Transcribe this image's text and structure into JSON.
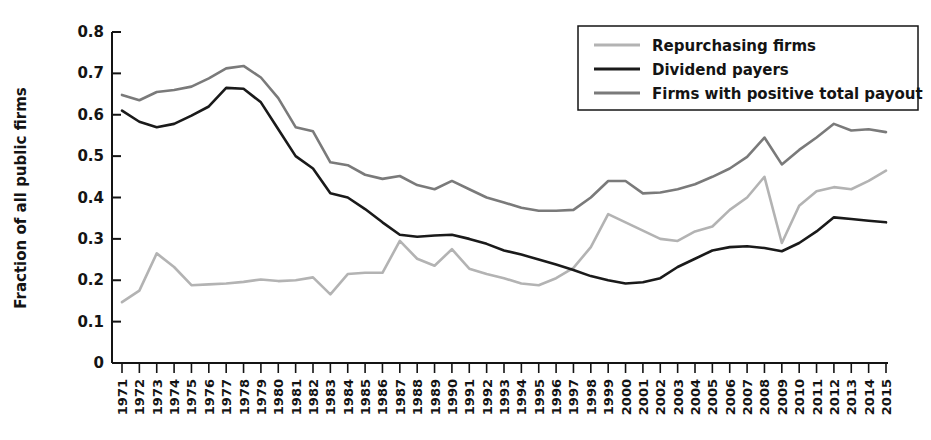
{
  "chart_data": {
    "type": "line",
    "title": "",
    "xlabel": "",
    "ylabel": "Fraction of all public firms",
    "ylim": [
      0,
      0.8
    ],
    "ytick_values": [
      0,
      0.1,
      0.2,
      0.3,
      0.4,
      0.5,
      0.6,
      0.7,
      0.8
    ],
    "ytick_labels": [
      "0",
      "0.1",
      "0.2",
      "0.3",
      "0.4",
      "0.5",
      "0.6",
      "0.7",
      "0.8"
    ],
    "grid": false,
    "legend_position": "top-right",
    "x": [
      1971,
      1972,
      1973,
      1974,
      1975,
      1976,
      1977,
      1978,
      1979,
      1980,
      1981,
      1982,
      1983,
      1984,
      1985,
      1986,
      1987,
      1988,
      1989,
      1990,
      1991,
      1992,
      1993,
      1994,
      1995,
      1996,
      1997,
      1998,
      1999,
      2000,
      2001,
      2002,
      2003,
      2004,
      2005,
      2006,
      2007,
      2008,
      2009,
      2010,
      2011,
      2012,
      2013,
      2014,
      2015
    ],
    "categories": [
      "1971",
      "1972",
      "1973",
      "1974",
      "1975",
      "1976",
      "1977",
      "1978",
      "1979",
      "1980",
      "1981",
      "1982",
      "1983",
      "1984",
      "1985",
      "1986",
      "1987",
      "1988",
      "1989",
      "1990",
      "1991",
      "1992",
      "1993",
      "1994",
      "1995",
      "1996",
      "1997",
      "1998",
      "1999",
      "2000",
      "2001",
      "2002",
      "2003",
      "2004",
      "2005",
      "2006",
      "2007",
      "2008",
      "2009",
      "2010",
      "2011",
      "2012",
      "2013",
      "2014",
      "2015"
    ],
    "series": [
      {
        "name": "Repurchasing firms",
        "color": "#b3b3b3",
        "values": [
          0.147,
          0.175,
          0.265,
          0.232,
          0.188,
          0.19,
          0.192,
          0.196,
          0.202,
          0.198,
          0.2,
          0.207,
          0.166,
          0.215,
          0.218,
          0.218,
          0.295,
          0.252,
          0.235,
          0.275,
          0.228,
          0.215,
          0.205,
          0.192,
          0.188,
          0.205,
          0.23,
          0.28,
          0.36,
          0.34,
          0.32,
          0.3,
          0.295,
          0.318,
          0.33,
          0.37,
          0.4,
          0.45,
          0.29,
          0.38,
          0.415,
          0.425,
          0.42,
          0.44,
          0.465
        ]
      },
      {
        "name": "Dividend payers",
        "color": "#1a1a1a",
        "values": [
          0.61,
          0.583,
          0.57,
          0.578,
          0.598,
          0.62,
          0.665,
          0.663,
          0.63,
          0.565,
          0.5,
          0.47,
          0.41,
          0.4,
          0.372,
          0.34,
          0.31,
          0.305,
          0.308,
          0.31,
          0.3,
          0.288,
          0.272,
          0.262,
          0.25,
          0.238,
          0.225,
          0.21,
          0.2,
          0.192,
          0.195,
          0.205,
          0.232,
          0.252,
          0.272,
          0.28,
          0.282,
          0.278,
          0.27,
          0.29,
          0.318,
          0.352,
          0.348,
          0.344,
          0.34
        ]
      },
      {
        "name": "Firms with positive total payout",
        "color": "#7a7a7a",
        "values": [
          0.648,
          0.635,
          0.655,
          0.66,
          0.668,
          0.688,
          0.712,
          0.718,
          0.69,
          0.64,
          0.57,
          0.56,
          0.485,
          0.478,
          0.455,
          0.445,
          0.452,
          0.43,
          0.42,
          0.44,
          0.42,
          0.4,
          0.388,
          0.375,
          0.368,
          0.368,
          0.37,
          0.4,
          0.44,
          0.44,
          0.41,
          0.412,
          0.42,
          0.432,
          0.45,
          0.47,
          0.498,
          0.545,
          0.48,
          0.515,
          0.545,
          0.578,
          0.562,
          0.565,
          0.558
        ]
      }
    ]
  },
  "legend": {
    "items": [
      {
        "label": "Repurchasing firms"
      },
      {
        "label": "Dividend payers"
      },
      {
        "label": "Firms with positive total payout"
      }
    ]
  },
  "axis": {
    "y_title": "Fraction of all public firms"
  }
}
